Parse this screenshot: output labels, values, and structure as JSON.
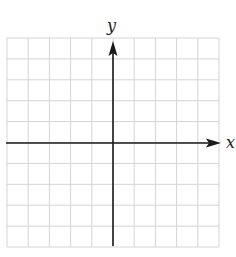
{
  "diagram": {
    "type": "coordinate-plane",
    "axes": {
      "x_label": "x",
      "y_label": "y"
    },
    "grid": {
      "columns": 10,
      "rows": 10,
      "origin_column": 5,
      "origin_row": 5,
      "line_color": "#d4d4d4",
      "axis_color": "#1a1a1a"
    }
  }
}
